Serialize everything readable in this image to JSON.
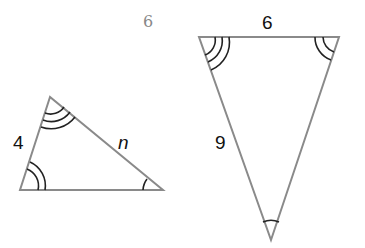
{
  "figure": {
    "stray_label": "6",
    "left_triangle": {
      "side_left_label": "4",
      "side_right_label": "n",
      "vertices": {
        "top": [
          50,
          97
        ],
        "bottom_left": [
          20,
          190
        ],
        "bottom_right": [
          163,
          190
        ]
      },
      "angle_marks": {
        "top": 3,
        "bottom_left": 2,
        "bottom_right": 1
      }
    },
    "right_triangle": {
      "side_top_label": "6",
      "side_left_label": "9",
      "vertices": {
        "top_left": [
          199,
          37
        ],
        "top_right": [
          339,
          37
        ],
        "bottom": [
          271,
          240
        ]
      },
      "angle_marks": {
        "top_left": 3,
        "top_right": 2,
        "bottom": 1
      }
    },
    "colors": {
      "stroke": "#8a8a8a",
      "arc": "#222222",
      "label": "#111111",
      "stray_label": "#888888"
    }
  }
}
